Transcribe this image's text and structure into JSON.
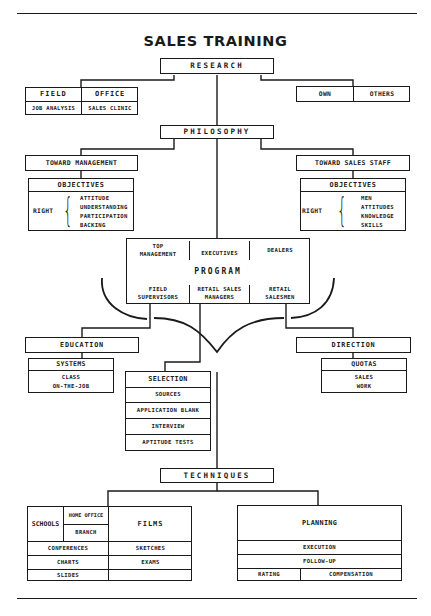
{
  "title": "SALES TRAINING",
  "research": {
    "label": "RESEARCH",
    "left": {
      "field": "FIELD",
      "office": "OFFICE",
      "job_analysis": "JOB ANALYSIS",
      "sales_clinic": "SALES CLINIC"
    },
    "right": {
      "own": "OWN",
      "others": "OTHERS"
    }
  },
  "philosophy": {
    "label": "PHILOSOPHY",
    "management": {
      "label": "TOWARD MANAGEMENT",
      "objectives": "OBJECTIVES",
      "right": "RIGHT",
      "items": [
        "ATTITUDE",
        "UNDERSTANDING",
        "PARTICIPATION",
        "BACKING"
      ]
    },
    "staff": {
      "label": "TOWARD SALES STAFF",
      "objectives": "OBJECTIVES",
      "right": "RIGHT",
      "items": [
        "MEN",
        "ATTITUDES",
        "KNOWLEDGE",
        "SKILLS"
      ]
    }
  },
  "program": {
    "label": "PROGRAM",
    "top": [
      "TOP\nMANAGEMENT",
      "EXECUTIVES",
      "DEALERS"
    ],
    "top_lines": [
      [
        "TOP",
        "MANAGEMENT"
      ],
      [
        "EXECUTIVES"
      ],
      [
        "DEALERS"
      ]
    ],
    "bottom_lines": [
      [
        "FIELD",
        "SUPERVISORS"
      ],
      [
        "RETAIL SALES",
        "MANAGERS"
      ],
      [
        "RETAIL",
        "SALESMEN"
      ]
    ]
  },
  "education": {
    "label": "EDUCATION",
    "systems": "SYSTEMS",
    "items": [
      "CLASS",
      "ON-THE-JOB"
    ]
  },
  "selection": {
    "label": "SELECTION",
    "items": [
      "SOURCES",
      "APPLICATION BLANK",
      "INTERVIEW",
      "APTITUDE TESTS"
    ]
  },
  "direction": {
    "label": "DIRECTION",
    "quotas": "QUOTAS",
    "items": [
      "SALES",
      "WORK"
    ]
  },
  "techniques": {
    "label": "TECHNIQUES",
    "left": {
      "schools": "SCHOOLS",
      "home_office": "HOME OFFICE",
      "branch": "BRANCH",
      "films": "FILMS",
      "rows": [
        [
          "CONFERENCES",
          "SKETCHES"
        ],
        [
          "CHARTS",
          "EXAMS"
        ],
        [
          "SLIDES",
          ""
        ]
      ]
    },
    "right": {
      "planning": "PLANNING",
      "execution": "EXECUTION",
      "follow_up": "FOLLOW-UP",
      "rating": "RATING",
      "compensation": "COMPENSATION"
    }
  }
}
